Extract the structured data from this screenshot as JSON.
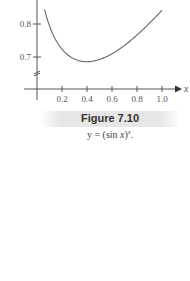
{
  "figure": {
    "title": "Figure 7.10",
    "caption_prefix": "y = (sin ",
    "caption_var": "x",
    "caption_close": ")",
    "caption_exp": "x",
    "caption_suffix": "."
  },
  "chart_data": {
    "type": "line",
    "title": "Figure 7.10",
    "subtitle": "y = (sin x)^x.",
    "xlabel": "x",
    "ylabel": "",
    "xlim": [
      0,
      1.05
    ],
    "ylim": [
      0.65,
      0.88
    ],
    "x_ticks": [
      0.2,
      0.4,
      0.6,
      0.8,
      1.0
    ],
    "x_tick_labels": [
      "0.2",
      "0.4",
      "0.6",
      "0.8",
      "1.0"
    ],
    "y_ticks": [
      0.7,
      0.8
    ],
    "y_tick_labels": [
      "0.7",
      "0.8"
    ],
    "grid": false,
    "axis_break_on_y": true,
    "series": [
      {
        "name": "y = (sin x)^x",
        "x": [
          0.1,
          0.15,
          0.2,
          0.25,
          0.3,
          0.35,
          0.4,
          0.45,
          0.5,
          0.6,
          0.7,
          0.8,
          0.9,
          1.0
        ],
        "values": [
          0.79,
          0.75,
          0.72,
          0.705,
          0.695,
          0.6925,
          0.692,
          0.695,
          0.7,
          0.716,
          0.738,
          0.766,
          0.799,
          0.841
        ]
      }
    ]
  }
}
